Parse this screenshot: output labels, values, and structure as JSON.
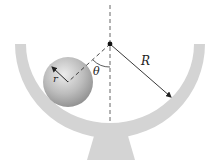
{
  "diagram": {
    "type": "physics-figure",
    "labels": {
      "big_radius": "R",
      "angle": "θ",
      "small_radius": "r"
    },
    "colors": {
      "bowl": "#d4d4d4",
      "ball_light": "#e6e6e6",
      "ball_dark": "#8f8f8f",
      "lines": "#333333",
      "pivot": "#111111"
    }
  }
}
